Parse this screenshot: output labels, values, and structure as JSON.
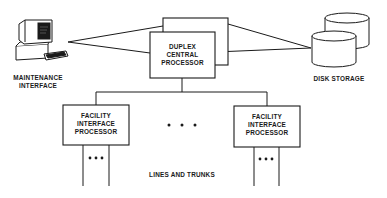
{
  "diagram": {
    "nodes": {
      "maintenance_interface": {
        "label_lines": [
          "MAINTENANCE",
          "INTERFACE"
        ],
        "icon": "computer-terminal-icon"
      },
      "central_processor": {
        "label_lines": [
          "DUPLEX",
          "CENTRAL",
          "PROCESSOR"
        ]
      },
      "disk_storage": {
        "label": "DISK STORAGE",
        "icon": "disk-storage-icon"
      },
      "fip_left": {
        "label_lines": [
          "FACILITY",
          "INTERFACE",
          "PROCESSOR"
        ]
      },
      "fip_right": {
        "label_lines": [
          "FACILITY",
          "INTERFACE",
          "PROCESSOR"
        ]
      }
    },
    "ellipsis_between_fips": "• • •",
    "lines_ellipsis": "•••",
    "lines_label": "LINES AND TRUNKS",
    "colors": {
      "ink": "#1a1a1a",
      "background": "#ffffff"
    }
  }
}
